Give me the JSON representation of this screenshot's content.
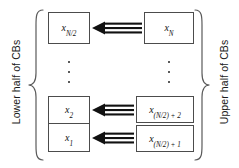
{
  "diagram": {
    "type": "block-diagram",
    "title": "",
    "labels": {
      "left_group": "Lower half of CBs",
      "right_group": "Upper half of CBs"
    },
    "left_column": {
      "group_label": "Lower half of CBs",
      "boxes": [
        {
          "id": "x_N_over_2",
          "base": "x",
          "subscript": "N/2"
        },
        {
          "id": "x_2",
          "base": "x",
          "subscript": "2"
        },
        {
          "id": "x_1",
          "base": "x",
          "subscript": "1"
        }
      ],
      "ellipsis": "⋮"
    },
    "right_column": {
      "group_label": "Upper half of CBs",
      "boxes": [
        {
          "id": "x_N",
          "base": "x",
          "subscript": "N"
        },
        {
          "id": "x_N_over_2_plus_2",
          "base": "x",
          "subscript": "(N/2) + 2"
        },
        {
          "id": "x_N_over_2_plus_1",
          "base": "x",
          "subscript": "(N/2) + 1"
        }
      ],
      "ellipsis": "⋮"
    },
    "arrows": [
      {
        "from": "x_N",
        "to": "x_N_over_2",
        "direction": "left"
      },
      {
        "from": "x_N_over_2_plus_2",
        "to": "x_2",
        "direction": "left"
      },
      {
        "from": "x_N_over_2_plus_1",
        "to": "x_1",
        "direction": "left"
      }
    ],
    "colors": {
      "box_border": "#4c4c4c",
      "arrow": "#111111",
      "text": "#111111",
      "brace": "#5a5a5a",
      "background": "#ffffff"
    }
  }
}
